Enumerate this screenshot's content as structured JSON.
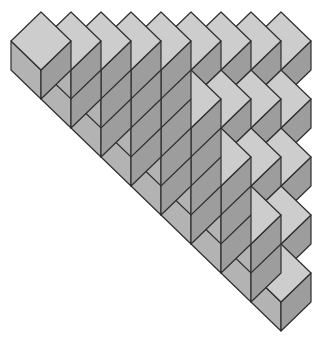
{
  "diagram": {
    "type": "cube-staircase",
    "cube": {
      "half_width": 30,
      "half_height": 29,
      "edge_height": 29
    },
    "origin": {
      "x": 41,
      "y": 12
    },
    "row_step": 58,
    "columns": [
      {
        "index": 0,
        "back_rows": 0,
        "stack_cubes": 1
      },
      {
        "index": 1,
        "back_rows": 0,
        "stack_cubes": 2
      },
      {
        "index": 2,
        "back_rows": 0,
        "stack_cubes": 3
      },
      {
        "index": 3,
        "back_rows": 0,
        "stack_cubes": 4
      },
      {
        "index": 4,
        "back_rows": 0,
        "stack_cubes": 5
      },
      {
        "index": 5,
        "back_rows": 1,
        "stack_cubes": 4
      },
      {
        "index": 6,
        "back_rows": 2,
        "stack_cubes": 3
      },
      {
        "index": 7,
        "back_rows": 3,
        "stack_cubes": 2
      },
      {
        "index": 8,
        "back_rows": 4,
        "stack_cubes": 1
      }
    ],
    "colors": {
      "top_face": "#cdcdcd",
      "left_face": "#b3b3b3",
      "right_face": "#9d9d9d",
      "outline": "#2e2e2e",
      "background": "#ffffff"
    }
  }
}
